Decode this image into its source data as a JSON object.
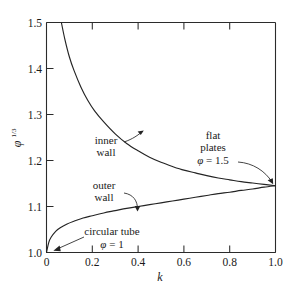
{
  "chart_data": {
    "type": "line",
    "title": "",
    "xlabel": "k",
    "ylabel": "φ^(1/3)",
    "xlim": [
      0.0,
      1.0
    ],
    "ylim": [
      1.0,
      1.5
    ],
    "grid": false,
    "legend_position": "none",
    "xticks": [
      0.0,
      0.2,
      0.4,
      0.6,
      0.8,
      1.0
    ],
    "xtick_labels": [
      "0",
      "0.2",
      "0.4",
      "0.6",
      "0.8",
      "1.0"
    ],
    "yticks": [
      1.0,
      1.1,
      1.2,
      1.3,
      1.4,
      1.5
    ],
    "ytick_labels": [
      "1.0",
      "1.1",
      "1.2",
      "1.3",
      "1.4",
      "1.5"
    ],
    "series": [
      {
        "name": "inner wall",
        "x": [
          0.065,
          0.08,
          0.1,
          0.12,
          0.15,
          0.18,
          0.21,
          0.25,
          0.3,
          0.35,
          0.4,
          0.45,
          0.5,
          0.55,
          0.6,
          0.65,
          0.7,
          0.75,
          0.8,
          0.85,
          0.9,
          0.95,
          1.0
        ],
        "values": [
          1.5,
          1.464,
          1.425,
          1.396,
          1.36,
          1.331,
          1.308,
          1.284,
          1.258,
          1.237,
          1.221,
          1.207,
          1.196,
          1.187,
          1.179,
          1.173,
          1.167,
          1.162,
          1.158,
          1.154,
          1.151,
          1.148,
          1.145
        ]
      },
      {
        "name": "outer wall",
        "x": [
          0.0,
          0.01,
          0.02,
          0.04,
          0.06,
          0.09,
          0.12,
          0.16,
          0.2,
          0.25,
          0.3,
          0.35,
          0.4,
          0.45,
          0.5,
          0.55,
          0.6,
          0.65,
          0.7,
          0.75,
          0.8,
          0.85,
          0.9,
          0.95,
          1.0
        ],
        "values": [
          1.0,
          1.022,
          1.033,
          1.046,
          1.054,
          1.062,
          1.068,
          1.075,
          1.08,
          1.086,
          1.091,
          1.096,
          1.1,
          1.104,
          1.108,
          1.112,
          1.116,
          1.12,
          1.124,
          1.128,
          1.131,
          1.135,
          1.138,
          1.142,
          1.145
        ]
      }
    ],
    "annotations": [
      {
        "id": "inner-wall",
        "lines": [
          "inner",
          "wall"
        ],
        "text_x": 0.175,
        "text_y": 1.252,
        "target_x": 0.265,
        "target_y": 1.277
      },
      {
        "id": "outer-wall",
        "lines": [
          "outer",
          "wall"
        ],
        "text_x": 0.185,
        "text_y": 1.156,
        "target_x": 0.305,
        "target_y": 1.093
      },
      {
        "id": "flat-plates",
        "lines": [
          "flat",
          "plates"
        ],
        "math": "φ = 1.5",
        "text_x": 0.695,
        "text_y": 1.262,
        "target_x": 0.995,
        "target_y": 1.149
      },
      {
        "id": "circular-tube",
        "lines": [
          "circular tube"
        ],
        "math": "φ = 1",
        "text_x": 0.245,
        "text_y": 1.041,
        "target_x": 0.012,
        "target_y": 1.006
      }
    ]
  },
  "labels": {
    "inner_wall_line1": "inner",
    "inner_wall_line2": "wall",
    "outer_wall_line1": "outer",
    "outer_wall_line2": "wall",
    "flat_plates_line1": "flat",
    "flat_plates_line2": "plates",
    "flat_plates_phi": "φ",
    "flat_plates_eq": " = 1.5",
    "circular_tube": "circular tube",
    "circular_tube_phi": "φ",
    "circular_tube_eq": " = 1",
    "x_axis_title": "k",
    "y_axis_phi": "φ",
    "y_axis_exp": "1/3"
  }
}
